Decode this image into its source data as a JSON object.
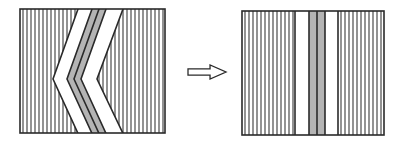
{
  "figure": {
    "description": "Schematic of a folded (chevron) layered band being straightened into vertical parallel bands",
    "arrow_label": "",
    "colors": {
      "stroke": "#2a2a2a",
      "hatch": "#3a3a3a",
      "band_white": "#ffffff",
      "band_gray": "#b4b4b4",
      "background": "#ffffff"
    },
    "left_panel": {
      "name": "folded-state",
      "box": {
        "x": 20,
        "y": 9,
        "w": 145,
        "h": 124
      },
      "hatch_spacing": 4,
      "chevron": {
        "tip_y": 79,
        "outer_white": {
          "top_x": 78,
          "tip_x": 53
        },
        "gray_left_outer": {
          "top_x": 92,
          "tip_x": 67
        },
        "gray_mid": {
          "top_x": 99,
          "tip_x": 74
        },
        "gray_right_outer": {
          "top_x": 106,
          "tip_x": 81
        },
        "inner_white": {
          "top_x": 123,
          "tip_x": 97
        }
      }
    },
    "arrow": {
      "name": "transform-arrow",
      "direction": "right",
      "x": 188,
      "y": 65,
      "w": 38,
      "h": 14
    },
    "right_panel": {
      "name": "straightened-state",
      "box": {
        "x": 242,
        "y": 11,
        "w": 142,
        "h": 124
      },
      "hatch_spacing": 4,
      "bands": [
        {
          "kind": "white",
          "x1": 295,
          "x2": 309
        },
        {
          "kind": "gray",
          "x1": 309,
          "x2": 317
        },
        {
          "kind": "gray",
          "x1": 317,
          "x2": 325
        },
        {
          "kind": "white",
          "x1": 325,
          "x2": 338
        }
      ]
    }
  }
}
